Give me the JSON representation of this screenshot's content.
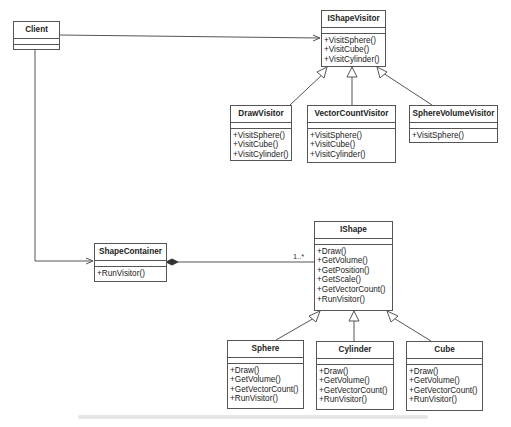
{
  "diagram": {
    "type": "UML class diagram (Visitor pattern)",
    "classes": {
      "client": {
        "name": "Client",
        "operations": []
      },
      "ishapevisitor": {
        "name": "IShapeVisitor",
        "operations": [
          "+VisitSphere()",
          "+VisitCube()",
          "+VisitCylinder()"
        ]
      },
      "drawvisitor": {
        "name": "DrawVisitor",
        "operations": [
          "+VisitSphere()",
          "+VisitCube()",
          "+VisitCylinder()"
        ]
      },
      "vectorcountvisitor": {
        "name": "VectorCountVisitor",
        "operations": [
          "+VisitSphere()",
          "+VisitCube()",
          "+VisitCylinder()"
        ]
      },
      "spherevolumevisitor": {
        "name": "SphereVolumeVisitor",
        "operations": [
          "+VisitSphere()"
        ]
      },
      "shapecontainer": {
        "name": "ShapeContainer",
        "operations": [
          "+RunVisitor()"
        ]
      },
      "ishape": {
        "name": "IShape",
        "operations": [
          "+Draw()",
          "+GetVolume()",
          "+GetPosition()",
          "+GetScale()",
          "+GetVectorCount()",
          "+RunVisitor()"
        ]
      },
      "sphere": {
        "name": "Sphere",
        "operations": [
          "+Draw()",
          "+GetVolume()",
          "+GetVectorCount()",
          "+RunVisitor()"
        ]
      },
      "cylinder": {
        "name": "Cylinder",
        "operations": [
          "+Draw()",
          "+GetVolume()",
          "+GetVectorCount()",
          "+RunVisitor()"
        ]
      },
      "cube": {
        "name": "Cube",
        "operations": [
          "+Draw()",
          "+GetVolume()",
          "+GetVectorCount()",
          "+RunVisitor()"
        ]
      }
    },
    "relations": [
      {
        "from": "Client",
        "to": "IShapeVisitor",
        "kind": "association"
      },
      {
        "from": "Client",
        "to": "ShapeContainer",
        "kind": "association"
      },
      {
        "from": "DrawVisitor",
        "to": "IShapeVisitor",
        "kind": "generalization"
      },
      {
        "from": "VectorCountVisitor",
        "to": "IShapeVisitor",
        "kind": "generalization"
      },
      {
        "from": "SphereVolumeVisitor",
        "to": "IShapeVisitor",
        "kind": "generalization"
      },
      {
        "from": "ShapeContainer",
        "to": "IShape",
        "kind": "composition",
        "multiplicity": "1..*"
      },
      {
        "from": "Sphere",
        "to": "IShape",
        "kind": "generalization"
      },
      {
        "from": "Cylinder",
        "to": "IShape",
        "kind": "generalization"
      },
      {
        "from": "Cube",
        "to": "IShape",
        "kind": "generalization"
      }
    ],
    "multiplicity_label": "1..*",
    "colors": {
      "line": "#555555",
      "background": "#ffffff",
      "text": "#222222"
    }
  }
}
